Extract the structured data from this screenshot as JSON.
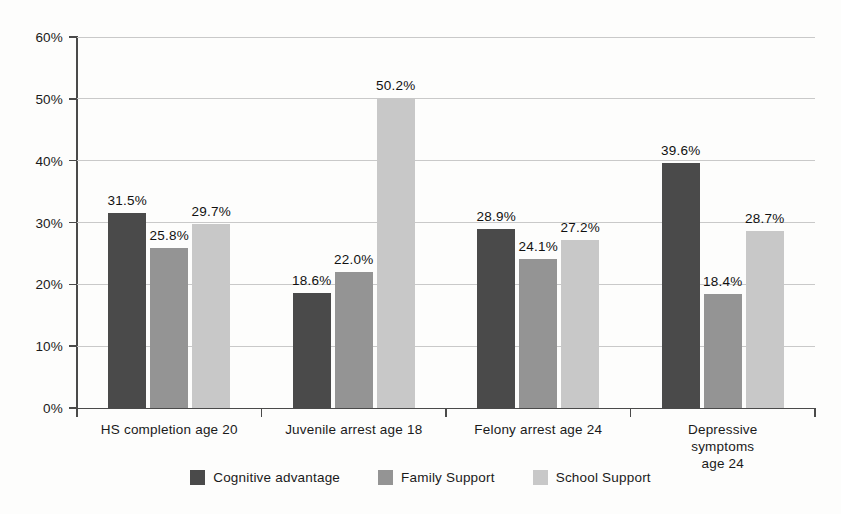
{
  "chart_data": {
    "type": "bar",
    "title": "",
    "subtitle": "",
    "xlabel": "",
    "ylabel": "",
    "ylim": [
      0,
      60
    ],
    "yticks": [
      "0%",
      "10%",
      "20%",
      "30%",
      "40%",
      "50%",
      "60%"
    ],
    "ytick_values": [
      0,
      10,
      20,
      30,
      40,
      50,
      60
    ],
    "grid": true,
    "legend_position": "bottom",
    "orientation": "vertical",
    "grouping": "grouped",
    "value_suffix": "%",
    "categories": [
      "HS completion age 20",
      "Juvenile arrest age 18",
      "Felony arrest age 24",
      "Depressive symptoms\nage 24"
    ],
    "series": [
      {
        "name": "Cognitive advantage",
        "color": "#4a4a4a",
        "values": [
          31.5,
          18.6,
          28.9,
          39.6
        ],
        "labels": [
          "31.5%",
          "18.6%",
          "28.9%",
          "39.6%"
        ]
      },
      {
        "name": "Family Support",
        "color": "#949494",
        "values": [
          25.8,
          22.0,
          24.1,
          18.4
        ],
        "labels": [
          "25.8%",
          "22.0%",
          "24.1%",
          "18.4%"
        ]
      },
      {
        "name": "School Support",
        "color": "#c8c8c8",
        "values": [
          29.7,
          50.2,
          27.2,
          28.7
        ],
        "labels": [
          "29.7%",
          "50.2%",
          "27.2%",
          "28.7%"
        ]
      }
    ]
  },
  "colors": {
    "background": "#fdfdfc",
    "axis": "#4a4a4a",
    "grid": "#c9c9c9",
    "text": "#1a1a1a"
  }
}
